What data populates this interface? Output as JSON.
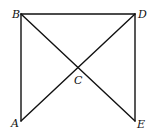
{
  "diagram": {
    "type": "geometry",
    "points": [
      {
        "id": "B",
        "label": "B",
        "x": 21,
        "y": 14,
        "lx": 12,
        "ly": 18
      },
      {
        "id": "D",
        "label": "D",
        "x": 135,
        "y": 14,
        "lx": 138,
        "ly": 18
      },
      {
        "id": "A",
        "label": "A",
        "x": 21,
        "y": 121,
        "lx": 11,
        "ly": 127
      },
      {
        "id": "E",
        "label": "E",
        "x": 135,
        "y": 121,
        "lx": 137,
        "ly": 128
      },
      {
        "id": "C",
        "label": "C",
        "x": 78,
        "y": 68,
        "lx": 74,
        "ly": 84
      }
    ],
    "segments": [
      {
        "from": "B",
        "to": "D"
      },
      {
        "from": "B",
        "to": "A"
      },
      {
        "from": "D",
        "to": "E"
      },
      {
        "from": "B",
        "to": "E"
      },
      {
        "from": "D",
        "to": "A"
      }
    ]
  }
}
